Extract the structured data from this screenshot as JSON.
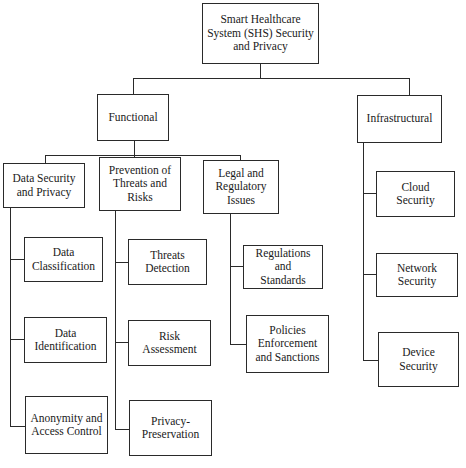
{
  "diagram": {
    "type": "hierarchy-tree",
    "root": {
      "label": "Smart Healthcare System (SHS) Security and Privacy",
      "lines": [
        "Smart Healthcare",
        "System (SHS) Security",
        "and Privacy"
      ]
    },
    "level1": [
      {
        "id": "functional",
        "label": "Functional",
        "lines": [
          "Functional"
        ],
        "children": [
          {
            "id": "data-security",
            "label": "Data Security and Privacy",
            "lines": [
              "Data Security",
              "and Privacy"
            ],
            "children": [
              {
                "label": "Data Classification",
                "lines": [
                  "Data",
                  "Classification"
                ]
              },
              {
                "label": "Data Identification",
                "lines": [
                  "Data",
                  "Identification"
                ]
              },
              {
                "label": "Anonymity and Access Control",
                "lines": [
                  "Anonymity and",
                  "Access Control"
                ]
              }
            ]
          },
          {
            "id": "prevention",
            "label": "Prevention of Threats and Risks",
            "lines": [
              "Prevention of",
              "Threats and",
              "Risks"
            ],
            "children": [
              {
                "label": "Threats Detection",
                "lines": [
                  "Threats",
                  "Detection"
                ]
              },
              {
                "label": "Risk Assessment",
                "lines": [
                  "Risk",
                  "Assessment"
                ]
              },
              {
                "label": "Privacy-Preservation",
                "lines": [
                  "Privacy-",
                  "Preservation"
                ]
              }
            ]
          },
          {
            "id": "legal",
            "label": "Legal and Regulatory Issues",
            "lines": [
              "Legal and",
              "Regulatory",
              "Issues"
            ],
            "children": [
              {
                "label": "Regulations and Standards",
                "lines": [
                  "Regulations and",
                  "Standards"
                ]
              },
              {
                "label": "Policies Enforcement and Sanctions",
                "lines": [
                  "Policies",
                  "Enforcement",
                  "and Sanctions"
                ]
              }
            ]
          }
        ]
      },
      {
        "id": "infrastructural",
        "label": "Infrastructural",
        "lines": [
          "Infrastructural"
        ],
        "children": [
          {
            "label": "Cloud Security",
            "lines": [
              "Cloud",
              "Security"
            ]
          },
          {
            "label": "Network Security",
            "lines": [
              "Network",
              "Security"
            ]
          },
          {
            "label": "Device Security",
            "lines": [
              "Device",
              "Security"
            ]
          }
        ]
      }
    ]
  },
  "colors": {
    "line": "#2a2a2a",
    "box_fill": "#ffffff",
    "text": "#1a1a1a"
  }
}
